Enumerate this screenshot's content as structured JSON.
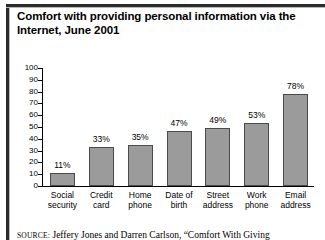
{
  "figure": {
    "title": "Comfort with providing personal information via the Internet, June 2001",
    "source_prefix": "SOURCE:",
    "source_text": "Jeffery Jones and Darren Carlson, “Comfort With Giving"
  },
  "chart_data": {
    "type": "bar",
    "title": "Comfort with providing personal information via the Internet, June 2001",
    "xlabel": "",
    "ylabel": "",
    "ylim": [
      0,
      100
    ],
    "yticks": [
      0,
      10,
      20,
      30,
      40,
      50,
      60,
      70,
      80,
      90,
      100
    ],
    "ytick_labels": [
      "0",
      "10",
      "20",
      "30",
      "40",
      "50",
      "60",
      "70",
      "80",
      "90",
      "100"
    ],
    "grid": false,
    "legend": "none",
    "categories": [
      "Social security",
      "Credit card",
      "Home phone",
      "Date of birth",
      "Street address",
      "Work phone",
      "Email address"
    ],
    "category_lines": [
      [
        "Social",
        "security"
      ],
      [
        "Credit",
        "card"
      ],
      [
        "Home",
        "phone"
      ],
      [
        "Date of",
        "birth"
      ],
      [
        "Street",
        "address"
      ],
      [
        "Work",
        "phone"
      ],
      [
        "Email",
        "address"
      ]
    ],
    "values": [
      11,
      33,
      35,
      47,
      49,
      53,
      78
    ],
    "value_labels": [
      "11%",
      "33%",
      "35%",
      "47%",
      "49%",
      "53%",
      "78%"
    ],
    "bar_color": "#9b9b9b",
    "bar_border_color": "#4a4a4a",
    "axis_color": "#000000"
  }
}
